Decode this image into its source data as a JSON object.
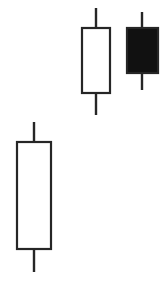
{
  "chart_data": {
    "type": "candlestick",
    "title": "",
    "subtitle": "",
    "xlabel": "",
    "ylabel": "",
    "grid": false,
    "legend": false,
    "axes_visible": false,
    "background_color": "#ffffff",
    "line_color": "#262626",
    "bullish_fill": "#ffffff",
    "bearish_fill": "#111111",
    "categories": [
      "1",
      "2",
      "3"
    ],
    "price_axis": {
      "orientation": "inverted-pixels",
      "note": "values given in pixel coordinates from top of image; lower pixel y = higher price"
    },
    "candles": [
      {
        "index": 1,
        "name": "candle-left-bullish",
        "direction": "bullish",
        "fill": "#ffffff",
        "center_x": 34,
        "body_left": 17,
        "body_right": 51,
        "body_top_y": 142,
        "body_bottom_y": 249,
        "wick_high_y": 122,
        "wick_low_y": 272,
        "open_y": 249,
        "close_y": 142,
        "high_y": 122,
        "low_y": 272,
        "body_width": 34,
        "body_height": 107
      },
      {
        "index": 2,
        "name": "candle-middle-bullish",
        "direction": "bullish",
        "fill": "#ffffff",
        "center_x": 96,
        "body_left": 82,
        "body_right": 110,
        "body_top_y": 28,
        "body_bottom_y": 93,
        "wick_high_y": 8,
        "wick_low_y": 115,
        "open_y": 93,
        "close_y": 28,
        "high_y": 8,
        "low_y": 115,
        "body_width": 28,
        "body_height": 65
      },
      {
        "index": 3,
        "name": "candle-right-bearish",
        "direction": "bearish",
        "fill": "#111111",
        "center_x": 142,
        "body_left": 127,
        "body_right": 158,
        "body_top_y": 28,
        "body_bottom_y": 73,
        "wick_high_y": 12,
        "wick_low_y": 90,
        "open_y": 28,
        "close_y": 73,
        "high_y": 12,
        "low_y": 90,
        "body_width": 31,
        "body_height": 45
      }
    ]
  }
}
